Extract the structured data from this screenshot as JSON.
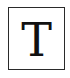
{
  "tool": {
    "name": "text-tool",
    "icon": "text-icon",
    "glyph": "T",
    "border_color": "#2a2a2a",
    "glyph_color": "#111111"
  }
}
